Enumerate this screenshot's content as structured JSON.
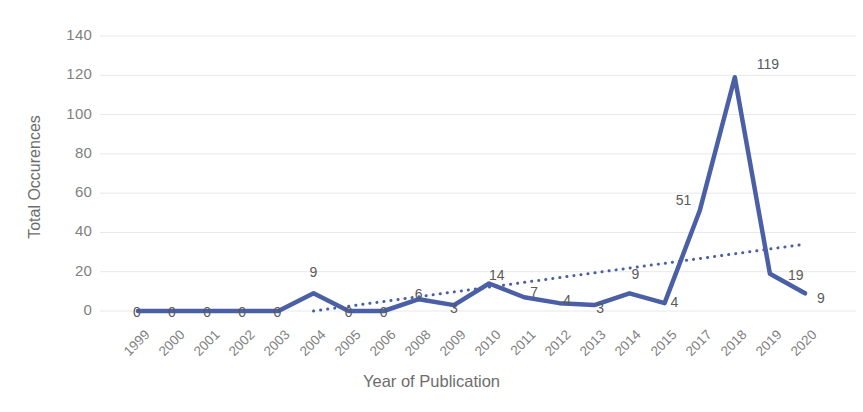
{
  "chart_data": {
    "type": "line",
    "title": "",
    "xlabel": "Year of Publication",
    "ylabel": "Total Occurences",
    "categories": [
      "1999",
      "2000",
      "2001",
      "2002",
      "2003",
      "2004",
      "2005",
      "2006",
      "2008",
      "2009",
      "2010",
      "2011",
      "2012",
      "2013",
      "2014",
      "2015",
      "2017",
      "2018",
      "2019",
      "2020"
    ],
    "values": [
      0,
      0,
      0,
      0,
      0,
      9,
      0,
      0,
      6,
      3,
      14,
      7,
      4,
      3,
      9,
      4,
      51,
      119,
      19,
      9
    ],
    "data_labels": [
      "0",
      "0",
      "0",
      "0",
      "0",
      "9",
      "0",
      "0",
      "6",
      "3",
      "14",
      "7",
      "4",
      "3",
      "9",
      "4",
      "51",
      "119",
      "19",
      "9"
    ],
    "series": [
      {
        "name": "Total Occurences",
        "style": "solid",
        "color": "#4A5FA5",
        "values": [
          0,
          0,
          0,
          0,
          0,
          9,
          0,
          0,
          6,
          3,
          14,
          7,
          4,
          3,
          9,
          4,
          51,
          119,
          19,
          9
        ]
      },
      {
        "name": "Linear trendline",
        "style": "dotted",
        "color": "#4A5FA5",
        "start": {
          "x_index": 5,
          "y": 0
        },
        "end": {
          "x_index": 19,
          "y": 34
        }
      }
    ],
    "yticks": [
      0,
      20,
      40,
      60,
      80,
      100,
      120,
      140
    ],
    "ylim": [
      0,
      140
    ],
    "grid": true,
    "grid_color": "#e8e8e8",
    "legend": "none",
    "line_color": "#4A5FA5",
    "label_color": "#5a5a5a",
    "tick_color": "#7f7f7f"
  }
}
